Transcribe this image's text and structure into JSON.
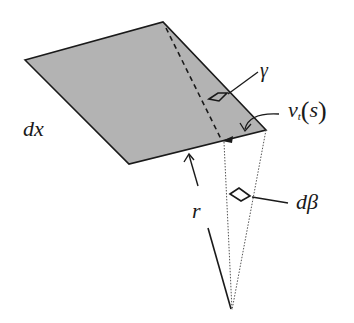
{
  "figure": {
    "type": "geometric-diagram",
    "colors": {
      "fill": "#b3b3b3",
      "stroke": "#1a1a1a",
      "background": "#ffffff"
    }
  },
  "labels": {
    "dx": "dx",
    "gamma": "γ",
    "vt_main": "v",
    "vt_sub": "t",
    "vt_open": "(",
    "vt_arg": "s",
    "vt_close": ")",
    "dbeta": "dβ",
    "r": "r"
  }
}
